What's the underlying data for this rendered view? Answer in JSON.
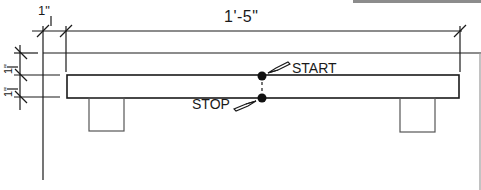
{
  "drawing": {
    "title": "Shelf / beam elevation with dimension callouts",
    "dimensions": {
      "top_small": "1\"",
      "top_main": "1'-5\"",
      "left_upper": "1\"",
      "left_lower": "1\""
    },
    "markers": {
      "start_label": "START",
      "stop_label": "STOP"
    },
    "colors": {
      "line": "#1a1a1a",
      "background": "#ffffff",
      "topbar": "#8c8c8c"
    }
  }
}
